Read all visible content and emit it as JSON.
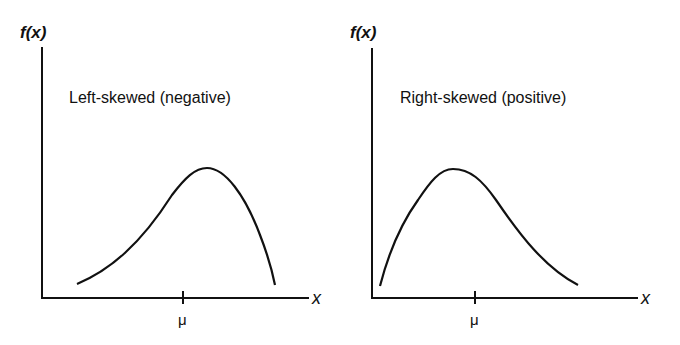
{
  "panels": [
    {
      "title": "Left-skewed (negative)",
      "y_axis_label": "f(x)",
      "x_axis_label": "x",
      "tick_label": "μ",
      "skew": "negative"
    },
    {
      "title": "Right-skewed (positive)",
      "y_axis_label": "f(x)",
      "x_axis_label": "x",
      "tick_label": "μ",
      "skew": "positive"
    }
  ],
  "colors": {
    "ink": "#111111",
    "background": "#ffffff"
  }
}
